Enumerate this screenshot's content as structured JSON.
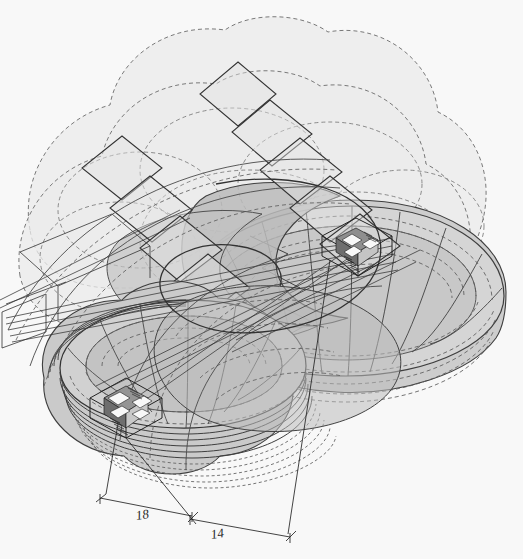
{
  "drawing": {
    "title": "Axonometric projection study",
    "kind": "architectural-axonometric",
    "background_color": "#ffffff",
    "canvas": {
      "width": 523,
      "height": 559
    }
  },
  "palette": {
    "background": "#ffffff",
    "line_dark": "#2b2b2b",
    "line_mid": "#555555",
    "line_light": "#8c8c8c",
    "fill_lightest": "#f0f0f0",
    "fill_light": "#e4e4e4",
    "fill_mid": "#d4d4d4",
    "fill_mid_dark": "#c2c2c2",
    "fill_dark": "#ababab",
    "fill_darkest": "#949494",
    "detail_white": "#ffffff",
    "detail_black": "#111111"
  },
  "dimensions": [
    {
      "id": "dim-18",
      "label": "18",
      "x": 143,
      "y": 519,
      "angle": -9
    },
    {
      "id": "dim-14",
      "label": "14",
      "x": 218,
      "y": 538,
      "angle": -9
    }
  ],
  "layers": [
    {
      "name": "dashed-cloud-outlines",
      "style": "dashed",
      "note": "upper overlapping circle envelopes"
    },
    {
      "name": "terraced-disc-upper",
      "style": "solid-filled",
      "note": "large shaded plateau, upper right"
    },
    {
      "name": "terraced-disc-lower-left",
      "style": "solid-filled",
      "note": "stacked circular discs, lower left"
    },
    {
      "name": "diamond-chain",
      "style": "solid-outline",
      "note": "chain of rotated squares running diagonally"
    },
    {
      "name": "radial-grid",
      "style": "solid+dashed",
      "note": "radial and concentric contour grid"
    },
    {
      "name": "projection-rays",
      "style": "thin-solid",
      "note": "long converging sight lines"
    },
    {
      "name": "detail-box-upper",
      "style": "solid",
      "note": "small boxed building detail, upper centre-right"
    },
    {
      "name": "detail-box-lower",
      "style": "solid",
      "note": "small boxed building detail, lower left"
    },
    {
      "name": "dimension-lines",
      "style": "thin-solid-with-ticks",
      "note": "baseline dimensions 18 and 14"
    }
  ],
  "detail_boxes": [
    {
      "id": "detail-box-upper",
      "cx": 357,
      "cy": 240,
      "w": 66,
      "h": 46
    },
    {
      "id": "detail-box-lower",
      "cx": 126,
      "cy": 400,
      "w": 66,
      "h": 48
    }
  ]
}
